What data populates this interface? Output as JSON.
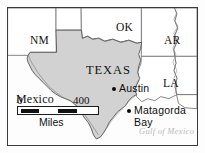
{
  "figure": {
    "kind": "reference-map",
    "frame_border_color": "#3a3a3a",
    "background_color": "#ffffff"
  },
  "map": {
    "land_fill_color": "#d2d2d2",
    "land_stroke_color": "#555555",
    "neighbor_fill_color": "#ffffff",
    "neighbor_stroke_color": "#6b6b6b",
    "water_fill_color": "#fdfdfd",
    "subject_region": "TEXAS"
  },
  "labels": {
    "states": [
      {
        "name": "label-nm",
        "text": "NM",
        "x": 22,
        "y": 27
      },
      {
        "name": "label-ok",
        "text": "OK",
        "x": 108,
        "y": 14
      },
      {
        "name": "label-ar",
        "text": "AR",
        "x": 156,
        "y": 27
      },
      {
        "name": "label-la",
        "text": "LA",
        "x": 155,
        "y": 70
      }
    ],
    "subject": {
      "name": "label-texas",
      "text": "TEXAS",
      "x": 78,
      "y": 56
    },
    "country": {
      "name": "label-mexico",
      "text": "Mexico",
      "x": 8,
      "y": 85
    },
    "water": {
      "name": "label-gulf-of-mexico",
      "text": "Gulf of Mexico",
      "x": 131,
      "y": 119
    }
  },
  "cities": [
    {
      "name": "city-austin",
      "text": "Austin",
      "dot_x": 104,
      "dot_y": 79,
      "label_x": 111,
      "label_y": 75
    },
    {
      "name": "city-matagorda-bay",
      "text": "Matagorda",
      "text_line2": "Bay",
      "dot_x": 119,
      "dot_y": 101,
      "label_x": 126,
      "label_y": 97
    }
  ],
  "scale": {
    "min_label": "0",
    "max_label": "400",
    "units_label": "Miles"
  }
}
